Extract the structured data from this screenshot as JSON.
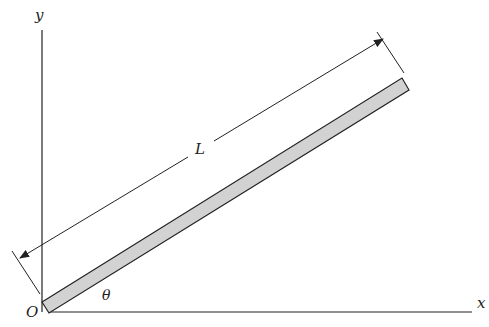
{
  "diagram": {
    "axes": {
      "x_label": "x",
      "y_label": "y",
      "origin_label": "O"
    },
    "rod": {
      "length_label": "L",
      "angle_label": "θ",
      "fill_color": "#d2d2d2",
      "stroke_color": "#222222"
    }
  }
}
